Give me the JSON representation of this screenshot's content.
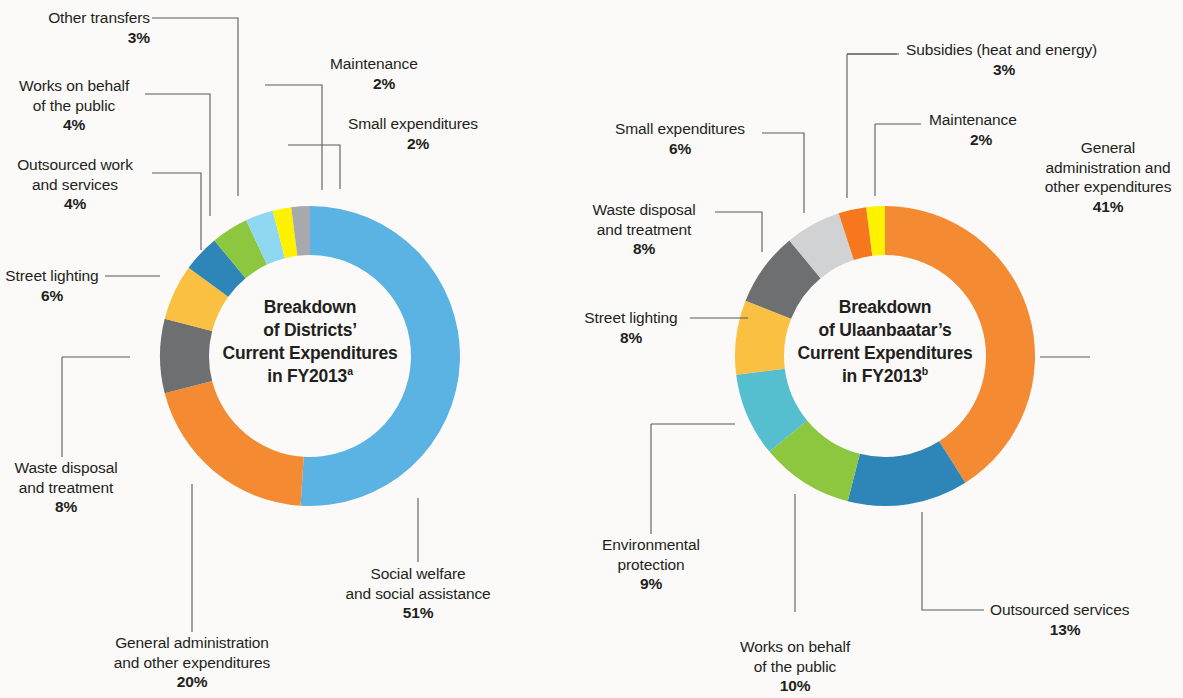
{
  "figure": {
    "background_color": "#fbfaf8",
    "palette": {
      "sky_blue": "#5BB3E4",
      "orange": "#F48A32",
      "dark_gray": "#6E6F71",
      "amber": "#F9C041",
      "steel_blue": "#2E86B8",
      "green": "#8DC63F",
      "light_blue": "#8FD8F2",
      "yellow": "#FFF200",
      "gray": "#A7A9AC",
      "light_gray": "#D0D2D3",
      "teal": "#55BFD0",
      "orange_dark": "#F7771F"
    }
  },
  "chart_data": [
    {
      "type": "pie",
      "id": "districts",
      "title": "Breakdown of Districts’ Current Expenditures in FY2013",
      "title_lines": [
        "Breakdown",
        "of Districts’",
        "Current Expenditures",
        "in FY2013"
      ],
      "title_superscript": "a",
      "donut": true,
      "legend_position": "callout-labels",
      "categories": [
        "Social welfare and social assistance",
        "General administration and other expenditures",
        "Waste disposal and treatment",
        "Street lighting",
        "Outsourced work and services",
        "Works on behalf of the public",
        "Other transfers",
        "Maintenance",
        "Small expenditures"
      ],
      "values": [
        51,
        20,
        8,
        6,
        4,
        4,
        3,
        2,
        2
      ],
      "slices": [
        {
          "label_lines": [
            "Social welfare",
            "and social assistance"
          ],
          "value": 51,
          "pct": "51%",
          "color": "#5BB3E4"
        },
        {
          "label_lines": [
            "General administration",
            "and other expenditures"
          ],
          "value": 20,
          "pct": "20%",
          "color": "#F48A32"
        },
        {
          "label_lines": [
            "Waste disposal",
            "and treatment"
          ],
          "value": 8,
          "pct": "8%",
          "color": "#6E6F71"
        },
        {
          "label_lines": [
            "Street lighting"
          ],
          "value": 6,
          "pct": "6%",
          "color": "#F9C041"
        },
        {
          "label_lines": [
            "Outsourced work",
            "and services"
          ],
          "value": 4,
          "pct": "4%",
          "color": "#2E86B8"
        },
        {
          "label_lines": [
            "Works on behalf",
            "of the public"
          ],
          "value": 4,
          "pct": "4%",
          "color": "#8DC63F"
        },
        {
          "label_lines": [
            "Other transfers"
          ],
          "value": 3,
          "pct": "3%",
          "color": "#8FD8F2"
        },
        {
          "label_lines": [
            "Maintenance"
          ],
          "value": 2,
          "pct": "2%",
          "color": "#FFF200"
        },
        {
          "label_lines": [
            "Small expenditures"
          ],
          "value": 2,
          "pct": "2%",
          "color": "#A7A9AC"
        }
      ]
    },
    {
      "type": "pie",
      "id": "ulaanbaatar",
      "title": "Breakdown of Ulaanbaatar’s Current Expenditures in FY2013",
      "title_lines": [
        "Breakdown",
        "of Ulaanbaatar’s",
        "Current Expenditures",
        "in FY2013"
      ],
      "title_superscript": "b",
      "donut": true,
      "legend_position": "callout-labels",
      "categories": [
        "General administration and other expenditures",
        "Outsourced services",
        "Works on behalf of the public",
        "Environmental protection",
        "Street lighting",
        "Waste disposal and treatment",
        "Small expenditures",
        "Subsidies (heat and energy)",
        "Maintenance"
      ],
      "values": [
        41,
        13,
        10,
        9,
        8,
        8,
        6,
        3,
        2
      ],
      "slices": [
        {
          "label_lines": [
            "General",
            "administration and",
            "other expenditures"
          ],
          "value": 41,
          "pct": "41%",
          "color": "#F48A32"
        },
        {
          "label_lines": [
            "Outsourced services"
          ],
          "value": 13,
          "pct": "13%",
          "color": "#2E86B8"
        },
        {
          "label_lines": [
            "Works on behalf",
            "of the public"
          ],
          "value": 10,
          "pct": "10%",
          "color": "#8DC63F"
        },
        {
          "label_lines": [
            "Environmental",
            "protection"
          ],
          "value": 9,
          "pct": "9%",
          "color": "#55BFD0"
        },
        {
          "label_lines": [
            "Street lighting"
          ],
          "value": 8,
          "pct": "8%",
          "color": "#F9C041"
        },
        {
          "label_lines": [
            "Waste disposal",
            "and treatment"
          ],
          "value": 8,
          "pct": "8%",
          "color": "#6E6F71"
        },
        {
          "label_lines": [
            "Small expenditures"
          ],
          "value": 6,
          "pct": "6%",
          "color": "#D0D2D3"
        },
        {
          "label_lines": [
            "Subsidies (heat and energy)"
          ],
          "value": 3,
          "pct": "3%",
          "color": "#F7771F"
        },
        {
          "label_lines": [
            "Maintenance"
          ],
          "value": 2,
          "pct": "2%",
          "color": "#FFF200"
        }
      ]
    }
  ],
  "left_chart": {
    "center": {
      "line1": "Breakdown",
      "line2": "of Districts’",
      "line3": "Current Expenditures",
      "line4": "in FY2013",
      "sup": "a"
    },
    "labels": {
      "other_transfers": {
        "l1": "Other transfers",
        "pct": "3%"
      },
      "works_public": {
        "l1": "Works on behalf",
        "l2": "of the public",
        "pct": "4%"
      },
      "outsourced": {
        "l1": "Outsourced work",
        "l2": "and services",
        "pct": "4%"
      },
      "street_lighting": {
        "l1": "Street lighting",
        "pct": "6%"
      },
      "waste": {
        "l1": "Waste disposal",
        "l2": "and treatment",
        "pct": "8%"
      },
      "gen_admin": {
        "l1": "General administration",
        "l2": "and other expenditures",
        "pct": "20%"
      },
      "social": {
        "l1": "Social welfare",
        "l2": "and social assistance",
        "pct": "51%"
      },
      "maintenance": {
        "l1": "Maintenance",
        "pct": "2%"
      },
      "small_exp": {
        "l1": "Small expenditures",
        "pct": "2%"
      }
    }
  },
  "right_chart": {
    "center": {
      "line1": "Breakdown",
      "line2": "of Ulaanbaatar’s",
      "line3": "Current Expenditures",
      "line4": "in FY2013",
      "sup": "b"
    },
    "labels": {
      "subsidies": {
        "l1": "Subsidies (heat and energy)",
        "pct": "3%"
      },
      "maintenance": {
        "l1": "Maintenance",
        "pct": "2%"
      },
      "small_exp": {
        "l1": "Small expenditures",
        "pct": "6%"
      },
      "waste": {
        "l1": "Waste disposal",
        "l2": "and treatment",
        "pct": "8%"
      },
      "street_lighting": {
        "l1": "Street lighting",
        "pct": "8%"
      },
      "environmental": {
        "l1": "Environmental",
        "l2": "protection",
        "pct": "9%"
      },
      "works_public": {
        "l1": "Works on behalf",
        "l2": "of the public",
        "pct": "10%"
      },
      "outsourced": {
        "l1": "Outsourced services",
        "pct": "13%"
      },
      "gen_admin": {
        "l1": "General",
        "l2": "administration and",
        "l3": "other expenditures",
        "pct": "41%"
      }
    }
  }
}
